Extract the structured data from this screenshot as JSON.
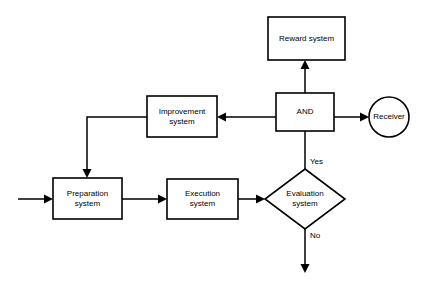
{
  "diagram": {
    "background_color": "#ffffff",
    "line_color": "#000000",
    "nodes": [
      {
        "id": "reward-system",
        "label": "Reward system",
        "shape": "rectangle",
        "x": 268,
        "y": 17,
        "w": 77,
        "h": 43
      },
      {
        "id": "improvement-system",
        "label": "Improvement\nsystem",
        "shape": "rectangle",
        "x": 147,
        "y": 96,
        "w": 70,
        "h": 41
      },
      {
        "id": "and-gate",
        "label": "AND",
        "shape": "rectangle",
        "x": 276,
        "y": 93,
        "w": 58,
        "h": 38
      },
      {
        "id": "receiver",
        "label": "Receiver",
        "shape": "circle",
        "cx": 389,
        "cy": 117,
        "r": 20
      },
      {
        "id": "preparation-system",
        "label": "Preparation\nsystem",
        "shape": "rectangle",
        "x": 53,
        "y": 178,
        "w": 69,
        "h": 41
      },
      {
        "id": "execution-system",
        "label": "Execution\nsystem",
        "shape": "rectangle",
        "x": 167,
        "y": 179,
        "w": 71,
        "h": 40
      },
      {
        "id": "evaluation-system",
        "label": "Evaluation\nsystem",
        "shape": "diamond",
        "cx": 305,
        "cy": 199,
        "rx": 40,
        "ry": 30
      }
    ],
    "edge_labels": [
      {
        "id": "yes-label",
        "text": "Yes",
        "x": 310,
        "y": 157
      },
      {
        "id": "no-label",
        "text": "No",
        "x": 310,
        "y": 231
      }
    ],
    "edges": [
      {
        "id": "input-to-preparation",
        "from": "input",
        "to": "preparation-system"
      },
      {
        "id": "preparation-to-execution",
        "from": "preparation-system",
        "to": "execution-system"
      },
      {
        "id": "execution-to-evaluation",
        "from": "execution-system",
        "to": "evaluation-system"
      },
      {
        "id": "evaluation-yes-to-and",
        "from": "evaluation-system",
        "to": "and-gate",
        "label": "Yes"
      },
      {
        "id": "evaluation-no-output",
        "from": "evaluation-system",
        "to": "output",
        "label": "No"
      },
      {
        "id": "and-to-reward",
        "from": "and-gate",
        "to": "reward-system"
      },
      {
        "id": "and-to-receiver",
        "from": "and-gate",
        "to": "receiver"
      },
      {
        "id": "and-to-improvement",
        "from": "and-gate",
        "to": "improvement-system"
      },
      {
        "id": "improvement-to-preparation",
        "from": "improvement-system",
        "to": "preparation-system"
      }
    ]
  }
}
